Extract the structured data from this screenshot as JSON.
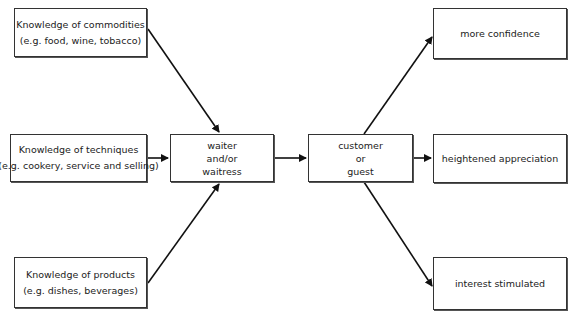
{
  "diagram": {
    "inputs": [
      {
        "title": "Knowledge of commodities",
        "subtitle": "(e.g. food, wine, tobacco)"
      },
      {
        "title": "Knowledge of techniques",
        "subtitle": "(e.g. cookery, service and selling)"
      },
      {
        "title": "Knowledge of products",
        "subtitle": "(e.g. dishes, beverages)"
      }
    ],
    "server": {
      "line1": "waiter",
      "line2": "and/or",
      "line3": "waitress"
    },
    "customer": {
      "line1": "customer",
      "line2": "or",
      "line3": "guest"
    },
    "outcomes": [
      {
        "label": "more confidence"
      },
      {
        "label": "heightened appreciation"
      },
      {
        "label": "interest stimulated"
      }
    ]
  }
}
